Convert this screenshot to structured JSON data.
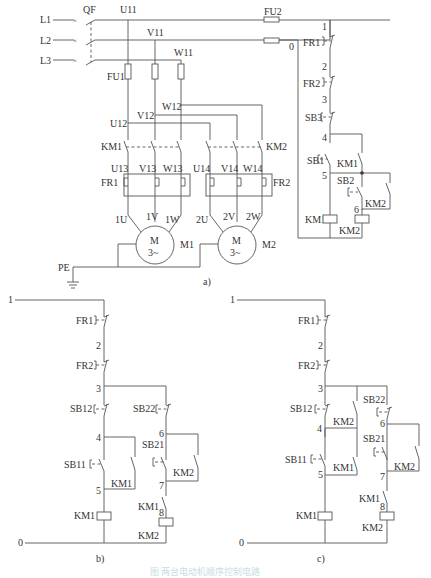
{
  "figure": {
    "panels": {
      "a": {
        "label": "a)",
        "lines": [
          "L1",
          "L2",
          "L3"
        ],
        "breaker": "QF",
        "fuses": {
          "main": "FU1",
          "control": "FU2"
        },
        "nodes": {
          "u11": "U11",
          "v11": "V11",
          "w11": "W11",
          "u12": "U12",
          "v12": "V12",
          "w12": "W12",
          "u13": "U13",
          "v13": "V13",
          "w13": "W13",
          "u14": "U14",
          "v14": "V14",
          "w14": "W14",
          "m1u": "1U",
          "m1v": "1V",
          "m1w": "1W",
          "m2u": "2U",
          "m2v": "2V",
          "m2w": "2W"
        },
        "contactors": {
          "km1": "KM1",
          "km2": "KM2"
        },
        "overloads": {
          "fr1": "FR1",
          "fr2": "FR2"
        },
        "motors": {
          "m1": {
            "name": "M1",
            "symbol": "M",
            "phase": "3~"
          },
          "m2": {
            "name": "M2",
            "symbol": "M",
            "phase": "3~"
          }
        },
        "ground": "PE",
        "control": {
          "wire_numbers": [
            "0",
            "1",
            "2",
            "3",
            "4",
            "5",
            "6"
          ],
          "fr1": "FR1",
          "fr2": "FR2",
          "sb3": "SB3",
          "sb1": "SB1",
          "sb2": "SB2",
          "km1_contact": "KM1",
          "km2_contact": "KM2",
          "km1_coil": "KM1",
          "km2_coil": "KM2"
        }
      },
      "b": {
        "label": "b)",
        "wire_numbers": [
          "0",
          "1",
          "2",
          "3",
          "4",
          "5",
          "6",
          "7",
          "8"
        ],
        "fr1": "FR1",
        "fr2": "FR2",
        "sb12": "SB12",
        "sb22": "SB22",
        "sb11": "SB11",
        "sb21": "SB21",
        "km1_contact": "KM1",
        "km2_contact": "KM2",
        "km1_interlock": "KM1",
        "km1_coil": "KM1",
        "km2_coil": "KM2"
      },
      "c": {
        "label": "c)",
        "wire_numbers": [
          "0",
          "1",
          "2",
          "3",
          "4",
          "5",
          "6",
          "7",
          "8"
        ],
        "fr1": "FR1",
        "fr2": "FR2",
        "sb12": "SB12",
        "sb22": "SB22",
        "sb11": "SB11",
        "sb21": "SB21",
        "km2_parallel": "KM2",
        "km1_contact": "KM1",
        "km2_contact": "KM2",
        "km1_interlock": "KM1",
        "km1_coil": "KM1",
        "km2_coil": "KM2"
      }
    },
    "caption": "图 两台电动机顺序控制电路"
  }
}
